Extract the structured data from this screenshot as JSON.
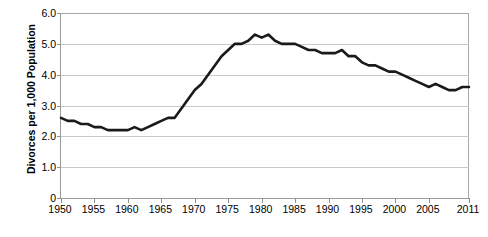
{
  "chart_data": {
    "type": "line",
    "title": "",
    "xlabel": "",
    "ylabel": "Divorces per 1,000 Population",
    "xlim": [
      1950,
      2011
    ],
    "ylim": [
      0,
      6.0
    ],
    "grid": true,
    "legend": "none",
    "line_color": "#1a1a1a",
    "grid_color": "#c9c9c9",
    "axis_color": "#9a9a9a",
    "y_ticks": [
      "6.0",
      "5.0",
      "4.0",
      "3.0",
      "2.0",
      "1.0",
      "0"
    ],
    "y_tick_values": [
      6.0,
      5.0,
      4.0,
      3.0,
      2.0,
      1.0,
      0
    ],
    "x_ticks": [
      "1950",
      "1955",
      "1960",
      "1965",
      "1970",
      "1975",
      "1980",
      "1985",
      "1990",
      "1995",
      "2000",
      "2005",
      "2011"
    ],
    "x_tick_values": [
      1950,
      1955,
      1960,
      1965,
      1970,
      1975,
      1980,
      1985,
      1990,
      1995,
      2000,
      2005,
      2011
    ],
    "series": [
      {
        "name": "Divorce rate",
        "x": [
          1950,
          1951,
          1952,
          1953,
          1954,
          1955,
          1956,
          1957,
          1958,
          1959,
          1960,
          1961,
          1962,
          1963,
          1964,
          1965,
          1966,
          1967,
          1968,
          1969,
          1970,
          1971,
          1972,
          1973,
          1974,
          1975,
          1976,
          1977,
          1978,
          1979,
          1980,
          1981,
          1982,
          1983,
          1984,
          1985,
          1986,
          1987,
          1988,
          1989,
          1990,
          1991,
          1992,
          1993,
          1994,
          1995,
          1996,
          1997,
          1998,
          1999,
          2000,
          2001,
          2002,
          2003,
          2004,
          2005,
          2006,
          2007,
          2008,
          2009,
          2010,
          2011
        ],
        "values": [
          2.6,
          2.5,
          2.5,
          2.4,
          2.4,
          2.3,
          2.3,
          2.2,
          2.2,
          2.2,
          2.2,
          2.3,
          2.2,
          2.3,
          2.4,
          2.5,
          2.6,
          2.6,
          2.9,
          3.2,
          3.5,
          3.7,
          4.0,
          4.3,
          4.6,
          4.8,
          5.0,
          5.0,
          5.1,
          5.3,
          5.2,
          5.3,
          5.1,
          5.0,
          5.0,
          5.0,
          4.9,
          4.8,
          4.8,
          4.7,
          4.7,
          4.7,
          4.8,
          4.6,
          4.6,
          4.4,
          4.3,
          4.3,
          4.2,
          4.1,
          4.1,
          4.0,
          3.9,
          3.8,
          3.7,
          3.6,
          3.7,
          3.6,
          3.5,
          3.5,
          3.6,
          3.6
        ]
      }
    ]
  }
}
